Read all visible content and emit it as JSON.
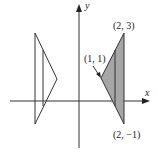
{
  "diagram": {
    "type": "coordinate-plane",
    "axes": {
      "x_label": "x",
      "y_label": "y",
      "origin_px": [
        79,
        101
      ],
      "unit_px": 22.7
    },
    "shaded_triangle": {
      "fill": "#a6a6a6",
      "stroke": "#333333",
      "vertices": [
        [
          1,
          1
        ],
        [
          2,
          3
        ],
        [
          2,
          -1
        ]
      ],
      "inner_line_x": 1.6
    },
    "outline_triangle": {
      "stroke": "#333333",
      "vertices_px": [
        [
          35,
          33
        ],
        [
          57,
          79
        ],
        [
          35,
          124
        ]
      ],
      "inner_line_px": [
        [
          43,
          50
        ],
        [
          43,
          106
        ]
      ]
    },
    "labels": {
      "top_vertex": "(2, 3)",
      "left_vertex": "(1, 1)",
      "bottom_vertex": "(2, −1)"
    }
  }
}
